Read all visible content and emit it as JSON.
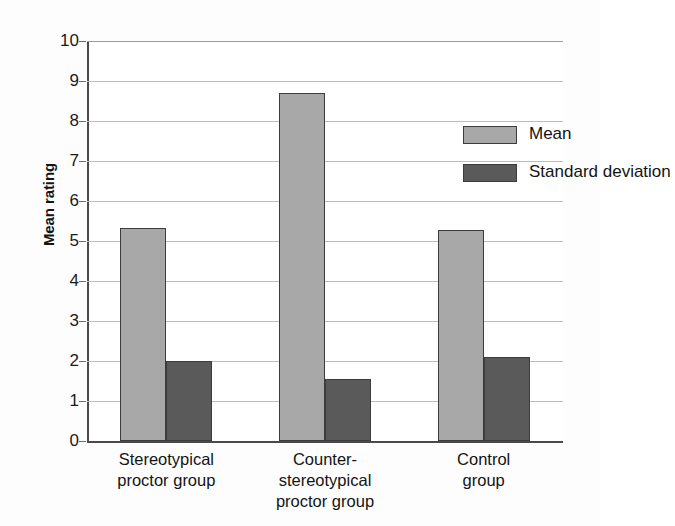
{
  "chart_data": {
    "type": "bar",
    "title": "",
    "xlabel": "",
    "ylabel": "Mean rating",
    "ylim": [
      0,
      10
    ],
    "ytick_step": 1,
    "yticks": [
      "10",
      "9",
      "8",
      "7",
      "6",
      "5",
      "4",
      "3",
      "2",
      "1",
      "0"
    ],
    "grid": true,
    "legend_position": "upper-right-inside",
    "categories": [
      "Stereotypical\nproctor group",
      "Counter-\nstereotypical\nproctor group",
      "Control\ngroup"
    ],
    "category_lines": [
      [
        "Stereotypical",
        "proctor group"
      ],
      [
        "Counter-",
        "stereotypical",
        "proctor group"
      ],
      [
        "Control",
        "group"
      ]
    ],
    "series": [
      {
        "name": "Mean",
        "color": "#a8a8a8",
        "values": [
          5.33,
          8.7,
          5.28
        ]
      },
      {
        "name": "Standard deviation",
        "color": "#5a5a5a",
        "values": [
          2.0,
          1.55,
          2.1
        ]
      }
    ]
  },
  "legend": {
    "items": [
      {
        "label": "Mean",
        "color": "#a8a8a8"
      },
      {
        "label": "Standard deviation",
        "color": "#5a5a5a"
      }
    ]
  },
  "axis": {
    "y_title": "Mean rating"
  },
  "colors": {
    "mean_fill": "#a8a8a8",
    "sd_fill": "#5a5a5a",
    "bar_outline": "#3c3c3c",
    "gridline": "#bcbcbc",
    "axis": "#4a4a4a",
    "text": "#141414",
    "background": "#ffffff"
  }
}
